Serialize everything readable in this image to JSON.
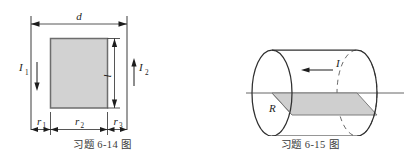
{
  "sheet": {
    "background_color": "#ffffff",
    "width": 415,
    "height": 161
  },
  "figures": [
    {
      "id": "fig-6-14",
      "caption": "习题 6-14 图",
      "type": "cross-section-of-two-parallel-wires-and-rectangular-loop",
      "labels": {
        "width_total": "d",
        "height": "l",
        "gap_left": "r",
        "gap_left_sub": "1",
        "loop_width": "r",
        "loop_width_sub": "2",
        "gap_right": "r",
        "gap_right_sub": "3",
        "current_left": "I",
        "current_left_sub": "1",
        "current_right": "I",
        "current_right_sub": "2"
      },
      "current_directions": {
        "left_wire": "down",
        "right_wire": "up"
      },
      "colors": {
        "loop_fill": "#d2d2d2",
        "loop_stroke": "#6d6d6d",
        "wire_stroke": "#555555",
        "dimension_stroke": "#2b2b2b"
      }
    },
    {
      "id": "fig-6-15",
      "caption": "习题 6-15 图",
      "type": "cylinder-with-axial-current-and-rectangular-cross-section",
      "labels": {
        "radius": "R",
        "current": "I"
      },
      "current_directions": {
        "axis": "left"
      },
      "colors": {
        "cross_section_fill": "#cfcfcf",
        "cross_section_stroke": "#7c7c7c",
        "outline_stroke": "#2f2f2f",
        "hidden_stroke": "#6a6a6a",
        "axis_stroke": "#555555"
      }
    }
  ]
}
